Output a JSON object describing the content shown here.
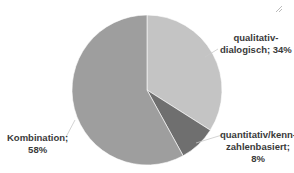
{
  "chart_data": {
    "type": "pie",
    "title": "",
    "categories": [
      "qualitativ-dialogisch",
      "quantitativ/kennzahlenbasiert",
      "Kombination"
    ],
    "values": [
      34,
      8,
      58
    ],
    "unit": "%",
    "start_angle_deg": 0,
    "direction": "clockwise",
    "colors": [
      "#c4c4c4",
      "#6f6f6f",
      "#9e9e9e"
    ],
    "labels": [
      {
        "line1": "qualitativ-",
        "line2": "dialogisch; 34%",
        "line3": ""
      },
      {
        "line1": "quantitativ/kenn-",
        "line2": "zahlenbasiert;",
        "line3": "8%"
      },
      {
        "line1": "Kombination;",
        "line2": "58%",
        "line3": ""
      }
    ],
    "legend": "none",
    "data_labels": "category; percentage, outside with leader lines"
  }
}
